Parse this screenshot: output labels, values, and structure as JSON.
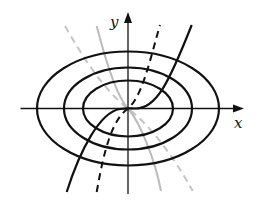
{
  "diagram": {
    "type": "phase-portrait",
    "axes": {
      "x_label": "x",
      "y_label": "y",
      "origin": [
        128,
        108.5
      ]
    },
    "ellipses": [
      {
        "name": "outer",
        "rx": 91,
        "ry": 57
      },
      {
        "name": "middle",
        "rx": 64,
        "ry": 41
      },
      {
        "name": "inner",
        "rx": 45,
        "ry": 28
      }
    ],
    "curves": [
      {
        "name": "solid-black-curve",
        "style": "solid",
        "color": "#111111"
      },
      {
        "name": "dashed-black-curve",
        "style": "dashed",
        "color": "#111111"
      },
      {
        "name": "solid-gray-curve",
        "style": "solid",
        "color": "#bbbbbb"
      },
      {
        "name": "dashed-gray-curve",
        "style": "dashed",
        "color": "#c4c4c4"
      }
    ]
  }
}
